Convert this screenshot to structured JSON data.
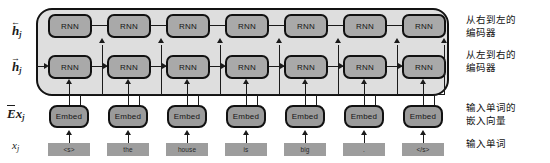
{
  "diagram": {
    "colors": {
      "container_fill": "#dedede",
      "rnn_fill": "#a9a9a9",
      "embed_fill": "#9b9b9b",
      "token_fill": "#9d9d9d",
      "stroke": "#111111",
      "background": "#ffffff"
    }
  },
  "left_labels": [
    {
      "id": "h-backward",
      "base": "h",
      "subscript": "j",
      "accent": "left-arrow",
      "overbar": false
    },
    {
      "id": "h-forward",
      "base": "h",
      "subscript": "j",
      "accent": "right-arrow",
      "overbar": false
    },
    {
      "id": "embedding",
      "base": "Ex",
      "subscript": "j",
      "accent": "none",
      "overbar": true
    },
    {
      "id": "input",
      "base": "x",
      "subscript": "j",
      "accent": "none",
      "overbar": false
    }
  ],
  "right_labels": [
    {
      "id": "right-to-left-encoder",
      "text": "从右到左的\n编码器"
    },
    {
      "id": "left-to-right-encoder",
      "text": "从左到右的\n编码器"
    },
    {
      "id": "input-word-embeddings",
      "text": "输入单词的\n嵌入向量"
    },
    {
      "id": "input-words",
      "text": "输入单词"
    }
  ],
  "rows": {
    "backward_rnn": {
      "label": "right-to-left RNN layer",
      "direction": "right-to-left",
      "cells": [
        "RNN",
        "RNN",
        "RNN",
        "RNN",
        "RNN",
        "RNN",
        "RNN"
      ]
    },
    "forward_rnn": {
      "label": "left-to-right RNN layer",
      "direction": "left-to-right",
      "cells": [
        "RNN",
        "RNN",
        "RNN",
        "RNN",
        "RNN",
        "RNN",
        "RNN"
      ]
    },
    "embed": {
      "label": "embedding layer",
      "cells": [
        "Embed",
        "Embed",
        "Embed",
        "Embed",
        "Embed",
        "Embed",
        "Embed"
      ]
    },
    "tokens": {
      "label": "input token sequence",
      "cells": [
        "<s>",
        "the",
        "house",
        "is",
        "big",
        ".",
        "</s>"
      ]
    }
  }
}
